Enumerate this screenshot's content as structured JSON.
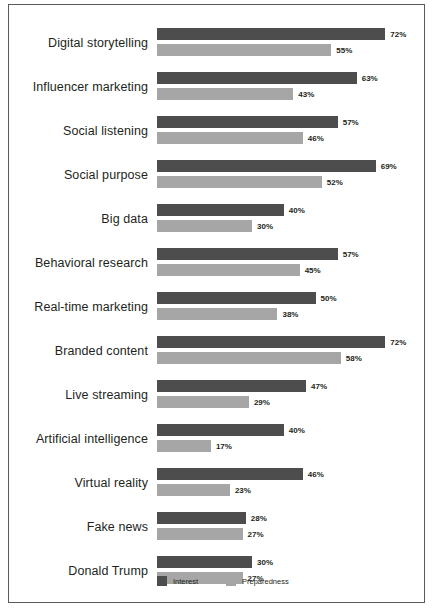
{
  "chart_data": {
    "type": "bar",
    "orientation": "horizontal",
    "title": "",
    "subtitle": "",
    "xlabel": "",
    "ylabel": "",
    "xlim": [
      0,
      80
    ],
    "grid": false,
    "legend_position": "bottom",
    "value_suffix": "%",
    "categories": [
      "Digital storytelling",
      "Influencer marketing",
      "Social listening",
      "Social purpose",
      "Big data",
      "Behavioral research",
      "Real-time marketing",
      "Branded content",
      "Live streaming",
      "Artificial intelligence",
      "Virtual reality",
      "Fake news",
      "Donald Trump"
    ],
    "series": [
      {
        "name": "Interest",
        "color": "#4d4d4d",
        "values": [
          72,
          63,
          57,
          69,
          40,
          57,
          50,
          72,
          47,
          40,
          46,
          28,
          30
        ],
        "labels": [
          "72%",
          "63%",
          "57%",
          "69%",
          "40%",
          "57%",
          "50%",
          "72%",
          "47%",
          "40%",
          "46%",
          "28%",
          "30%"
        ]
      },
      {
        "name": "Preparedness",
        "color": "#a6a6a6",
        "values": [
          55,
          43,
          46,
          52,
          30,
          45,
          38,
          58,
          29,
          17,
          23,
          27,
          27
        ],
        "labels": [
          "55%",
          "43%",
          "46%",
          "52%",
          "30%",
          "45%",
          "38%",
          "58%",
          "29%",
          "17%",
          "23%",
          "27%",
          "27%"
        ]
      }
    ]
  },
  "legend": {
    "items": [
      {
        "label": "Interest",
        "color": "#4d4d4d"
      },
      {
        "label": "Preparedness",
        "color": "#a6a6a6"
      }
    ]
  },
  "style": {
    "frame_color": "#5a5a5a",
    "background": "#ffffff",
    "text_color": "#231f20",
    "px_per_percent": 3.17
  }
}
